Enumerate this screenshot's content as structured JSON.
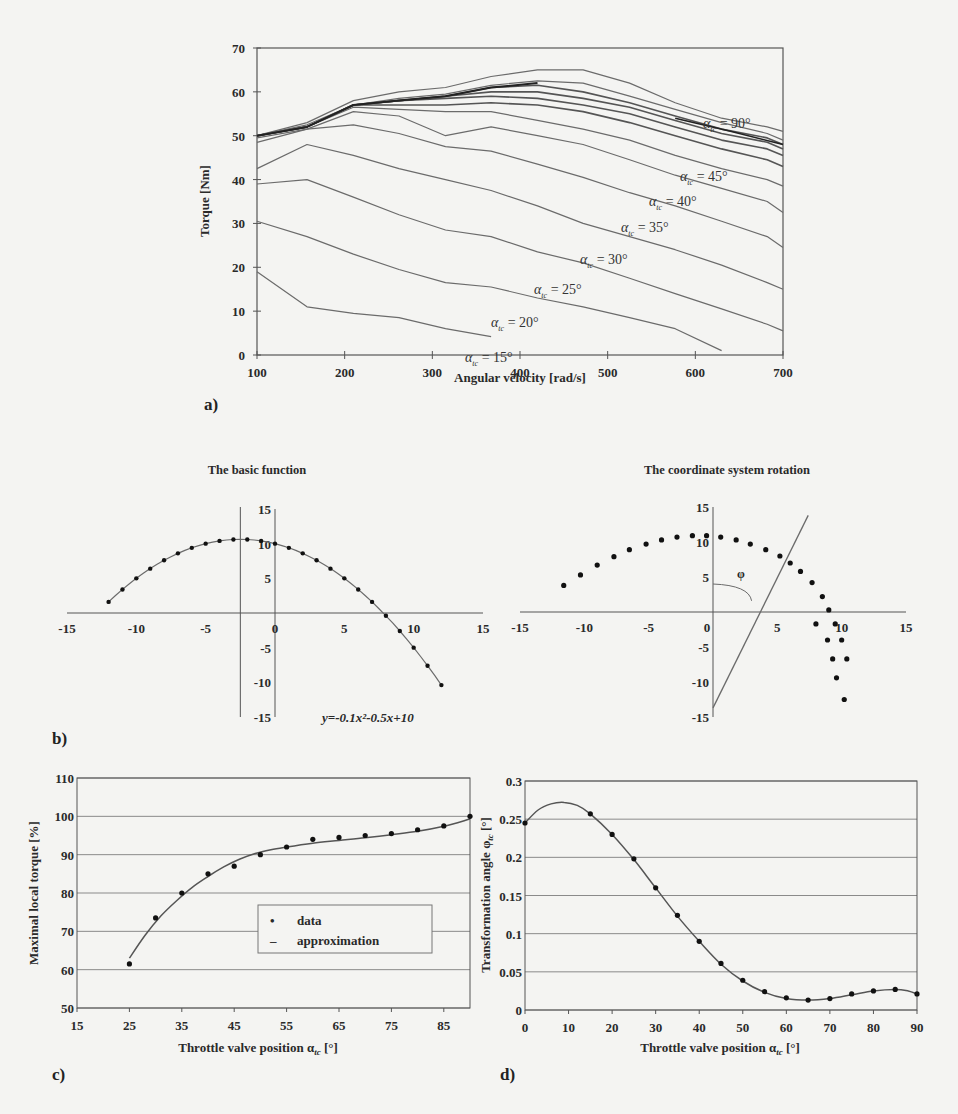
{
  "chart_data": [
    {
      "id": "a",
      "panel_label": "a)",
      "type": "line",
      "title": "",
      "xlabel": "Angular velocity [rad/s]",
      "ylabel": "Torque [Nm]",
      "xlim": [
        100,
        700
      ],
      "ylim": [
        0,
        70
      ],
      "xticks": [
        100,
        200,
        300,
        400,
        500,
        600,
        700
      ],
      "yticks": [
        0,
        10,
        20,
        30,
        40,
        50,
        60,
        70
      ],
      "grid": false,
      "x": [
        100,
        157,
        210,
        262,
        315,
        367,
        420,
        472,
        525,
        577,
        630,
        682,
        700
      ],
      "series": [
        {
          "name": "α_tc = 15°",
          "label": "α_tc = 15°",
          "values": [
            19,
            11,
            9.5,
            8.5,
            6,
            4.2,
            null,
            null,
            null,
            null,
            null,
            null,
            null
          ]
        },
        {
          "name": "α_tc = 20°",
          "label": "α_tc = 20°",
          "values": [
            30.5,
            27,
            23,
            19.5,
            16.5,
            15.5,
            13,
            11,
            8.5,
            6,
            1,
            null,
            null
          ]
        },
        {
          "name": "α_tc = 25°",
          "label": "α_tc = 25°",
          "values": [
            39,
            40,
            36,
            32,
            28.5,
            27,
            23.5,
            21,
            17.5,
            14,
            10.5,
            7,
            5.5
          ]
        },
        {
          "name": "α_tc = 30°",
          "label": "α_tc = 30°",
          "values": [
            42.5,
            48,
            45.5,
            42.5,
            40,
            37.5,
            34,
            30,
            27,
            24,
            20.5,
            16.5,
            15
          ]
        },
        {
          "name": "α_tc = 35°",
          "label": "α_tc = 35°",
          "values": [
            48.5,
            51.5,
            52.5,
            50.5,
            47.5,
            46.5,
            43.5,
            40.5,
            37,
            34,
            30.5,
            27,
            24.5
          ]
        },
        {
          "name": "α_tc = 40°",
          "label": "α_tc = 40°",
          "values": [
            49.5,
            51.5,
            55.5,
            54.5,
            50,
            52,
            50,
            48,
            44.5,
            41,
            38,
            35,
            32.5
          ]
        },
        {
          "name": "α_tc = 45°",
          "label": "α_tc = 45°",
          "values": [
            50,
            52,
            56.5,
            56,
            55.5,
            55.5,
            53.5,
            51.5,
            49,
            45.5,
            42.5,
            40,
            38.5
          ]
        },
        {
          "name": "α_tc = 50°",
          "label": "",
          "values": [
            50,
            52,
            57,
            57,
            57,
            57.5,
            57,
            55.5,
            53,
            50,
            47,
            44.5,
            43
          ]
        },
        {
          "name": "α_tc = 55°",
          "label": "",
          "values": [
            50,
            52,
            57,
            58,
            58.5,
            59,
            58.5,
            57,
            55,
            52,
            49,
            47,
            45.5
          ]
        },
        {
          "name": "α_tc = 60°",
          "label": "",
          "values": [
            50,
            52,
            57,
            58,
            59,
            60,
            60,
            58.5,
            56.5,
            53.5,
            50.5,
            48.5,
            47
          ]
        },
        {
          "name": "α_tc = 70°",
          "label": "",
          "values": [
            50,
            52,
            57,
            58,
            59,
            61,
            61.5,
            60,
            57.5,
            54.5,
            51.5,
            49.5,
            48
          ]
        },
        {
          "name": "α_tc = 80°",
          "label": "",
          "values": [
            50,
            52.5,
            57,
            58.5,
            59.5,
            61.5,
            62.5,
            62,
            59,
            56,
            53,
            50.5,
            49
          ]
        },
        {
          "name": "α_tc = 90°",
          "label": "α_tc = 90°",
          "values": [
            50,
            53,
            58,
            60,
            61,
            63.5,
            65,
            65,
            62,
            57.5,
            54,
            52,
            51
          ]
        }
      ],
      "annotations": [
        "α_tc = 90°",
        "α_tc = 45°",
        "α_tc = 40°",
        "α_tc = 35°",
        "α_tc = 30°",
        "α_tc = 25°",
        "α_tc = 20°",
        "α_tc = 15°"
      ]
    },
    {
      "id": "b1",
      "panel_label": "b)",
      "type": "scatter",
      "title": "The basic function",
      "xlabel": "",
      "ylabel": "",
      "xlim": [
        -15,
        15
      ],
      "ylim": [
        -15,
        15
      ],
      "xticks": [
        -15,
        -10,
        -5,
        0,
        5,
        10,
        15
      ],
      "yticks": [
        -15,
        -10,
        -5,
        5,
        10,
        15
      ],
      "grid": false,
      "equation": "y=-0.1x²-0.5x+10",
      "vertex_line_x": -2.5,
      "x": [
        -12,
        -11,
        -10,
        -9,
        -8,
        -7,
        -6,
        -5,
        -4,
        -3,
        -2,
        -1,
        0,
        1,
        2,
        3,
        4,
        5,
        6,
        7,
        8,
        9,
        10,
        11,
        12
      ],
      "y": [
        1.6,
        3.4,
        5,
        6.4,
        7.6,
        8.6,
        9.4,
        10,
        10.4,
        10.6,
        10.6,
        10.4,
        10,
        9.4,
        8.6,
        7.6,
        6.4,
        5,
        3.4,
        1.6,
        -0.4,
        -2.6,
        -5,
        -7.6,
        -10.4
      ]
    },
    {
      "id": "b2",
      "type": "scatter",
      "title": "The coordinate system rotation",
      "xlabel": "",
      "ylabel": "",
      "xlim": [
        -15,
        15
      ],
      "ylim": [
        -15,
        15
      ],
      "xticks": [
        -15,
        -10,
        -5,
        0,
        5,
        10,
        15
      ],
      "yticks": [
        -15,
        -10,
        -5,
        5,
        10,
        15
      ],
      "grid": false,
      "angle_label": "φ",
      "rotated_axis": {
        "x1": 0,
        "y1": -13.7,
        "x2": 7.4,
        "y2": 13.8
      },
      "x": [
        -11.6,
        -10.3,
        -9,
        -7.7,
        -6.5,
        -5.2,
        -4,
        -2.8,
        -1.6,
        -0.5,
        0.6,
        1.8,
        2.9,
        4.1,
        5.2,
        6,
        6.8,
        7.7,
        8.5,
        9,
        9.5,
        10,
        10.4
      ],
      "y": [
        3.8,
        5.3,
        6.7,
        7.9,
        8.9,
        9.7,
        10.3,
        10.7,
        10.9,
        10.9,
        10.7,
        10.3,
        9.7,
        8.9,
        8,
        7,
        5.8,
        4.2,
        2.2,
        0.3,
        -1.7,
        -4,
        -6.7,
        -9.4,
        -12.5
      ]
    },
    {
      "id": "c",
      "panel_label": "c)",
      "type": "scatter",
      "title": "",
      "xlabel": "Throttle valve position α_tc [°]",
      "ylabel": "Maximal local torque [%]",
      "xlim": [
        15,
        90
      ],
      "ylim": [
        50,
        110
      ],
      "xticks": [
        15,
        25,
        35,
        45,
        55,
        65,
        75,
        85
      ],
      "yticks": [
        50,
        60,
        70,
        80,
        90,
        100,
        110
      ],
      "grid": true,
      "legend": {
        "position": "center-right",
        "entries": [
          "data",
          "approximation"
        ]
      },
      "data": {
        "x": [
          25,
          30,
          35,
          40,
          45,
          50,
          55,
          60,
          65,
          70,
          75,
          80,
          85,
          90
        ],
        "y": [
          61.5,
          73.5,
          80,
          85,
          87,
          90,
          92,
          94,
          94.5,
          95,
          95.5,
          96.5,
          97.5,
          100
        ]
      },
      "approximation": {
        "x": [
          25,
          28,
          31,
          34,
          37,
          40,
          43,
          46,
          49,
          52,
          55,
          60,
          65,
          70,
          75,
          80,
          85,
          90
        ],
        "y": [
          63,
          69,
          74,
          78,
          81.5,
          84.3,
          86.8,
          88.8,
          90.3,
          91.3,
          92,
          93,
          93.7,
          94.4,
          95.2,
          96.1,
          97.4,
          99.3
        ]
      }
    },
    {
      "id": "d",
      "panel_label": "d)",
      "type": "scatter",
      "title": "",
      "xlabel": "Throttle valve position α_tc [°]",
      "ylabel": "Transformation angle φ_tc [°]",
      "xlim": [
        0,
        90
      ],
      "ylim": [
        0,
        0.3
      ],
      "xticks": [
        0,
        10,
        20,
        30,
        40,
        50,
        60,
        70,
        80,
        90
      ],
      "yticks": [
        0,
        0.05,
        0.1,
        0.15,
        0.2,
        0.25,
        0.3
      ],
      "grid": true,
      "data": {
        "x": [
          0,
          15,
          20,
          25,
          30,
          35,
          40,
          45,
          50,
          55,
          60,
          65,
          70,
          75,
          80,
          85,
          90
        ],
        "y": [
          0.245,
          0.257,
          0.23,
          0.198,
          0.16,
          0.124,
          0.09,
          0.061,
          0.039,
          0.024,
          0.016,
          0.013,
          0.015,
          0.021,
          0.025,
          0.027,
          0.021
        ]
      },
      "approximation": {
        "x": [
          0,
          3,
          6,
          9,
          12,
          15,
          20,
          25,
          30,
          35,
          40,
          45,
          50,
          55,
          60,
          65,
          70,
          75,
          80,
          85,
          88,
          90
        ],
        "y": [
          0.245,
          0.262,
          0.27,
          0.272,
          0.268,
          0.257,
          0.23,
          0.197,
          0.16,
          0.123,
          0.09,
          0.06,
          0.038,
          0.023,
          0.015,
          0.013,
          0.015,
          0.02,
          0.025,
          0.027,
          0.025,
          0.021
        ]
      }
    }
  ],
  "labels": {
    "a_panel": "a)",
    "b_panel": "b)",
    "c_panel": "c)",
    "d_panel": "d)",
    "a_xlabel": "Angular velocity [rad/s]",
    "a_ylabel": "Torque [Nm]",
    "b1_title": "The basic function",
    "b2_title": "The coordinate system rotation",
    "b1_equation": "y=-0.1x²-0.5x+10",
    "b2_angle": "φ",
    "c_ylabel": "Maximal local torque [%]",
    "c_xlabel": "Throttle valve position α",
    "d_ylabel": "Transformation angle φ",
    "d_xlabel": "Throttle valve position α",
    "subscript": "tc",
    "unit_deg": " [°]",
    "legend_data": "data",
    "legend_approx": "approximation",
    "legend_dot": "•",
    "legend_dash": "–"
  },
  "colors": {
    "background": "#f4f4f2",
    "line": "#6b6b6b",
    "dark_line": "#222222",
    "grid": "#8a8a8a",
    "axis": "#555555",
    "marker": "#111111"
  }
}
